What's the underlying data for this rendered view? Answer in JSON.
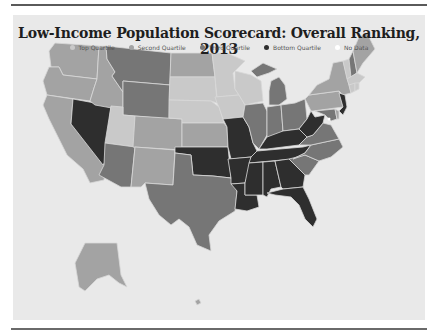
{
  "title": "Low-Income Population Scorecard: Overall Ranking, 2013",
  "legend": [
    {
      "label": "Top Quartile",
      "color": "#c9c9c9"
    },
    {
      "label": "Second Quartile",
      "color": "#a3a3a3"
    },
    {
      "label": "Third Quartile",
      "color": "#767676"
    },
    {
      "label": "Bottom Quartile",
      "color": "#2e2e2e"
    },
    {
      "label": "No Data",
      "color": "#ffffff"
    }
  ],
  "colors": {
    "background": "#e9e9e9",
    "state_border": "#d8d8d8",
    "top": "#c9c9c9",
    "second": "#a3a3a3",
    "third": "#767676",
    "bottom": "#2e2e2e"
  },
  "states": {
    "WA": "second",
    "OR": "second",
    "CA": "second",
    "NV": "bottom",
    "ID": "second",
    "MT": "third",
    "WY": "third",
    "UT": "top",
    "AZ": "third",
    "CO": "second",
    "NM": "second",
    "ND": "second",
    "SD": "top",
    "NE": "top",
    "KS": "second",
    "OK": "bottom",
    "TX": "third",
    "MN": "top",
    "IA": "top",
    "MO": "bottom",
    "AR": "bottom",
    "LA": "bottom",
    "WI": "top",
    "IL": "third",
    "MI": "third",
    "IN": "third",
    "OH": "third",
    "KY": "bottom",
    "TN": "bottom",
    "MS": "bottom",
    "AL": "bottom",
    "GA": "bottom",
    "FL": "bottom",
    "SC": "third",
    "NC": "third",
    "VA": "third",
    "WV": "bottom",
    "PA": "second",
    "NY": "second",
    "NJ": "bottom",
    "MD": "third",
    "DE": "second",
    "VT": "top",
    "NH": "third",
    "ME": "second",
    "MA": "top",
    "CT": "top",
    "RI": "top",
    "AK": "second",
    "HI": "second",
    "DC": "no_data"
  }
}
